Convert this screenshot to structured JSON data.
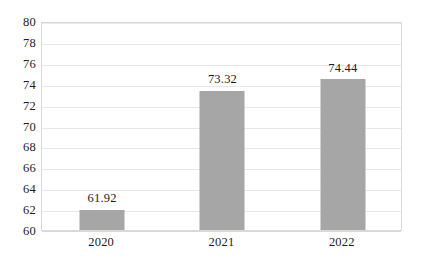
{
  "chart_data": {
    "type": "bar",
    "title": "",
    "subtitle": "",
    "xlabel": "",
    "ylabel": "",
    "categories": [
      "2020",
      "2021",
      "2022"
    ],
    "values": [
      61.92,
      73.32,
      74.44
    ],
    "data_labels": [
      "61.92",
      "73.32",
      "74.44"
    ],
    "ylim": [
      60,
      80
    ],
    "ytick_step": 2,
    "ytick_labels": [
      "80",
      "78",
      "76",
      "74",
      "72",
      "70",
      "68",
      "66",
      "64",
      "62",
      "60"
    ],
    "grid": true,
    "grid_axis": "y",
    "legend": false,
    "legend_position": "none",
    "series": [
      {
        "name": "",
        "values": [
          61.92,
          73.32,
          74.44
        ]
      }
    ],
    "colors": {
      "bar_fill": "#a6a6a6",
      "gridline": "#e8e8e8",
      "plot_border": "#d9d9d9",
      "text": "#1d1d1d",
      "background": "#ffffff"
    }
  }
}
